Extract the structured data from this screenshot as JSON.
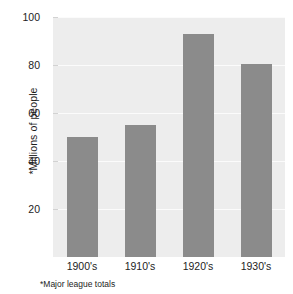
{
  "chart_data": {
    "type": "bar",
    "title": "",
    "xlabel": "",
    "ylabel": "*Millions of people",
    "footnote": "*Major league totals",
    "categories": [
      "1900's",
      "1910's",
      "1920's",
      "1930's"
    ],
    "values": [
      50,
      55,
      93,
      80.5
    ],
    "series": [
      {
        "name": "Attendance",
        "values": [
          50,
          55,
          93,
          80.5
        ]
      }
    ],
    "ylim": [
      0,
      100
    ],
    "yticks": [
      20,
      40,
      60,
      80,
      100
    ],
    "ytick_labels": [
      "20",
      "40",
      "60",
      "80",
      "100"
    ],
    "grid": true,
    "grid_axis": "y",
    "legend": false,
    "legend_position": "none",
    "bar_color": "#8b8b8b",
    "plot_background": "#ededed",
    "gridline_color": "#fbfbfb",
    "figure_background": "#ffffff"
  }
}
